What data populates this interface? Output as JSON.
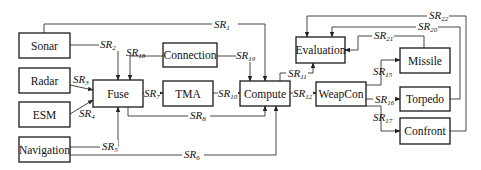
{
  "diagram": {
    "type": "signal-flow block diagram",
    "nodes": {
      "sonar": "Sonar",
      "radar": "Radar",
      "esm": "ESM",
      "navigation": "Navigation",
      "fuse": "Fuse",
      "connection": "Connection",
      "tma": "TMA",
      "compute": "Compute",
      "evaluation": "Evaluation",
      "weapcon": "WeapCon",
      "missile": "Missile",
      "torpedo": "Torpedo",
      "confront": "Confront"
    },
    "edges": {
      "sr1": {
        "prefix": "SR",
        "sub": "1",
        "from": "Sonar",
        "to": "Compute"
      },
      "sr2": {
        "prefix": "SR",
        "sub": "2",
        "from": "Sonar",
        "to": "Fuse"
      },
      "sr3": {
        "prefix": "SR",
        "sub": "3",
        "from": "Radar",
        "to": "Fuse"
      },
      "sr4": {
        "prefix": "SR",
        "sub": "4",
        "from": "ESM",
        "to": "Fuse"
      },
      "sr5": {
        "prefix": "SR",
        "sub": "5",
        "from": "Navigation",
        "to": "Fuse"
      },
      "sr6": {
        "prefix": "SR",
        "sub": "6",
        "from": "Navigation",
        "to": "Compute"
      },
      "sr7": {
        "prefix": "SR",
        "sub": "7",
        "from": "Fuse",
        "to": "TMA"
      },
      "sr8": {
        "prefix": "SR",
        "sub": "8",
        "from": "Fuse",
        "to": "Compute"
      },
      "sr10": {
        "prefix": "SR",
        "sub": "10",
        "from": "TMA",
        "to": "Compute"
      },
      "sr11": {
        "prefix": "SR",
        "sub": "11",
        "from": "Compute",
        "to": "Evaluation"
      },
      "sr12": {
        "prefix": "SR",
        "sub": "12",
        "from": "Compute",
        "to": "WeapCon"
      },
      "sr15": {
        "prefix": "SR",
        "sub": "15",
        "from": "WeapCon",
        "to": "Missile"
      },
      "sr16": {
        "prefix": "SR",
        "sub": "16",
        "from": "WeapCon",
        "to": "Torpedo"
      },
      "sr17": {
        "prefix": "SR",
        "sub": "17",
        "from": "WeapCon",
        "to": "Confront"
      },
      "sr18": {
        "prefix": "SR",
        "sub": "18",
        "from": "Connection",
        "to": "Fuse"
      },
      "sr19": {
        "prefix": "SR",
        "sub": "19",
        "from": "Connection",
        "to": "Compute"
      },
      "sr20": {
        "prefix": "SR",
        "sub": "20",
        "from": "Torpedo",
        "to": "Evaluation"
      },
      "sr21": {
        "prefix": "SR",
        "sub": "21",
        "from": "Missile",
        "to": "Evaluation"
      },
      "sr22": {
        "prefix": "SR",
        "sub": "22",
        "from": "Confront",
        "to": "Evaluation"
      }
    }
  }
}
